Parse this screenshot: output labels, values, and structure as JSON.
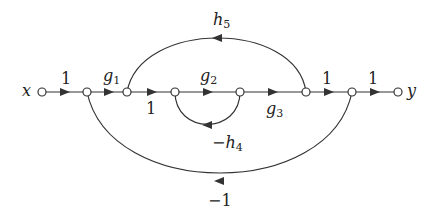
{
  "diagram": {
    "type": "signal-flow-graph",
    "input_label": "x",
    "output_label": "y",
    "edges": [
      {
        "from": "x",
        "to": "n1",
        "gain": "1"
      },
      {
        "from": "n1",
        "to": "n2",
        "gain": "g1",
        "gain_base": "g",
        "gain_sub": "1"
      },
      {
        "from": "n2",
        "to": "n3",
        "gain": "1"
      },
      {
        "from": "n3",
        "to": "n4",
        "gain": "g2",
        "gain_base": "g",
        "gain_sub": "2"
      },
      {
        "from": "n4",
        "to": "n5",
        "gain": "g3",
        "gain_base": "g",
        "gain_sub": "3"
      },
      {
        "from": "n5",
        "to": "n6",
        "gain": "1"
      },
      {
        "from": "n6",
        "to": "y",
        "gain": "1"
      },
      {
        "from": "n4",
        "to": "n3",
        "gain": "-h4",
        "gain_base": "−h",
        "gain_sub": "4"
      },
      {
        "from": "n5",
        "to": "n2",
        "gain": "h5",
        "gain_base": "h",
        "gain_sub": "5"
      },
      {
        "from": "n6",
        "to": "n1",
        "gain": "-1"
      }
    ],
    "labels": {
      "e_x_n1": "1",
      "g1_base": "g",
      "g1_sub": "1",
      "e_n2_n3": "1",
      "g2_base": "g",
      "g2_sub": "2",
      "g3_base": "g",
      "g3_sub": "3",
      "e_n5_n6": "1",
      "e_n6_y": "1",
      "h4_base": "−h",
      "h4_sub": "4",
      "h5_base": "h",
      "h5_sub": "5",
      "neg_one": "−1"
    },
    "colors": {
      "line": "#333333",
      "node_fill": "#ffffff"
    }
  }
}
